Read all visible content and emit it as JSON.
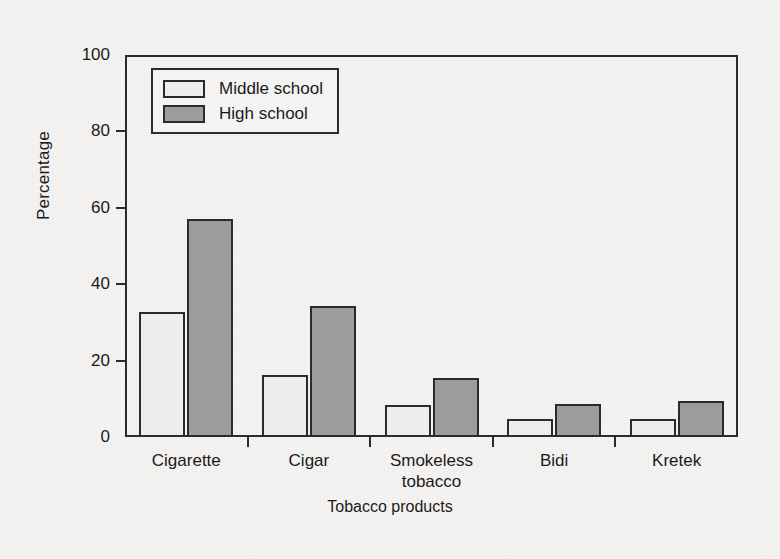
{
  "chart_data": {
    "type": "bar",
    "title": "",
    "xlabel": "Tobacco products",
    "ylabel": "Percentage",
    "ylim": [
      0,
      100
    ],
    "yticks": [
      0,
      20,
      40,
      60,
      80,
      100
    ],
    "grid": false,
    "legend_position": "top-left inside plot",
    "categories": [
      "Cigarette",
      "Cigar",
      "Smokeless\ntobacco",
      "Bidi",
      "Kretek"
    ],
    "series": [
      {
        "name": "Middle school",
        "color": "#ededeb",
        "values": [
          32.8,
          16.2,
          8.3,
          4.8,
          4.8
        ]
      },
      {
        "name": "High school",
        "color": "#9c9c9c",
        "values": [
          57.2,
          34.2,
          15.4,
          8.6,
          9.4
        ]
      }
    ]
  },
  "style": {
    "axis_color": "#2b2b2b",
    "background": "#f4f3f1",
    "bar_border": "#2b2b2b"
  }
}
